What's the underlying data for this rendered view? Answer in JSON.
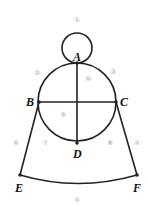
{
  "points": {
    "A": "A",
    "B": "B",
    "C": "C",
    "D": "D",
    "E": "E",
    "F": "F"
  },
  "labels": [
    "①",
    "②",
    "③",
    "④",
    "⑤",
    "⑥",
    "⑦",
    "⑧",
    "⑨",
    "⑩"
  ],
  "colors": {
    "line": "#222",
    "label": "#aaa"
  }
}
